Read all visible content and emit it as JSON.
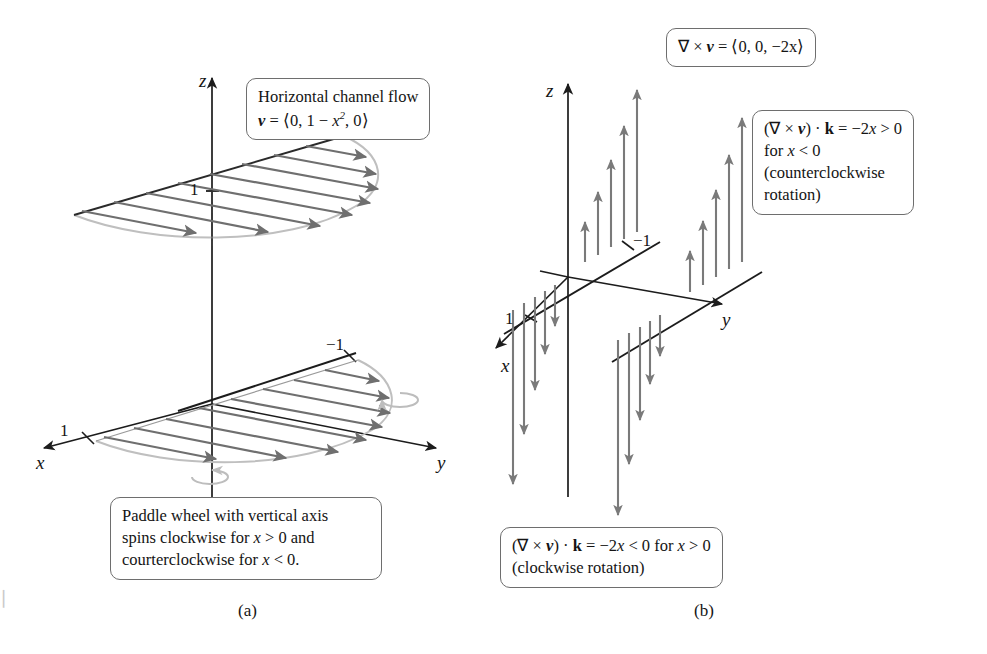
{
  "figure": {
    "panels": [
      {
        "id": "a",
        "caption": "(a)"
      },
      {
        "id": "b",
        "caption": "(b)"
      }
    ]
  },
  "panel_a": {
    "axes": {
      "z": "z",
      "x": "x",
      "y": "y"
    },
    "ticks": {
      "z_one": "1",
      "x_one": "1",
      "neg_one": "−1"
    },
    "callout_flow": {
      "line1": "Horizontal channel flow",
      "line2_lead": "v",
      "line2_eq": " = ⟨0, 1 − ",
      "line2_var": "x",
      "line2_exp": "2",
      "line2_tail": ", 0⟩"
    },
    "callout_paddle": {
      "line1": "Paddle wheel with vertical axis",
      "line2_a": "spins clockwise for ",
      "line2_var": "x",
      "line2_b": " > 0 and",
      "line3_a": "courterclockwise for ",
      "line3_var": "x",
      "line3_b": " < 0."
    }
  },
  "panel_b": {
    "axes": {
      "z": "z",
      "x": "x",
      "y": "y"
    },
    "ticks": {
      "x_one": "1",
      "neg_one": "−1"
    },
    "callout_curl": {
      "text": "∇ × ",
      "bold_v": "v",
      "tail": " = ⟨0, 0, −2x⟩"
    },
    "callout_ccw": {
      "line1_a": "(∇ × ",
      "line1_v": "v",
      "line1_b": ") · ",
      "line1_k": "k",
      "line1_c": " = −2",
      "line1_var": "x",
      "line1_d": " > 0",
      "line2_a": "for ",
      "line2_var": "x",
      "line2_b": " < 0",
      "line3": "(counterclockwise",
      "line4": "rotation)"
    },
    "callout_cw": {
      "line1_a": "(∇ × ",
      "line1_v": "v",
      "line1_b": ") · ",
      "line1_k": "k",
      "line1_c": " = −2",
      "line1_var": "x",
      "line1_d": " < 0 for ",
      "line1_var2": "x",
      "line1_e": " > 0",
      "line2": "(clockwise rotation)"
    }
  },
  "colors": {
    "axis": "#1c1c1c",
    "vector_arrow": "#6f6f6f",
    "curve_outline": "#b9b9b9",
    "box_border": "#6e6e6e",
    "text": "#141414",
    "background": "#ffffff"
  },
  "scan_artifact": "▏"
}
